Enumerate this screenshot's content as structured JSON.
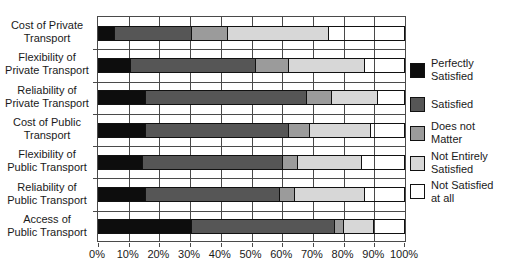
{
  "chart_data": {
    "type": "bar",
    "orientation": "horizontal",
    "stacked": true,
    "title": "",
    "xlabel": "",
    "ylabel": "",
    "xlim": [
      0,
      100
    ],
    "x_ticks": [
      "0%",
      "10%",
      "20%",
      "30%",
      "40%",
      "50%",
      "60%",
      "70%",
      "80%",
      "90%",
      "100%"
    ],
    "grid": "both",
    "legend_position": "right",
    "categories": [
      [
        "Cost of Private",
        "Transport"
      ],
      [
        "Flexibility of",
        "Private Transport"
      ],
      [
        "Reliability of",
        "Private Transport"
      ],
      [
        "Cost of Public",
        "Transport"
      ],
      [
        "Flexibility of",
        "Public Transport"
      ],
      [
        "Reliability of",
        "Public Transport"
      ],
      [
        "Access of",
        "Public Transport"
      ]
    ],
    "series": [
      {
        "name": "Perfectly Satisfied",
        "label_lines": [
          "Perfectly",
          "Satisfied"
        ],
        "color": "#0d0d0d",
        "values": [
          5,
          10,
          15,
          15,
          14,
          15,
          30
        ]
      },
      {
        "name": "Satisfied",
        "label_lines": [
          "Satisfied"
        ],
        "color": "#565656",
        "values": [
          25,
          41,
          53,
          47,
          46,
          44,
          47
        ]
      },
      {
        "name": "Does not Matter",
        "label_lines": [
          "Does not",
          "Matter"
        ],
        "color": "#9b9b9b",
        "values": [
          12,
          11,
          8,
          7,
          5,
          5,
          3
        ]
      },
      {
        "name": "Not Entirely Satisfied",
        "label_lines": [
          "Not Entirely",
          "Satisfied"
        ],
        "color": "#d7d7d7",
        "values": [
          33,
          25,
          15,
          20,
          21,
          23,
          10
        ]
      },
      {
        "name": "Not Satisfied at all",
        "label_lines": [
          "Not Satisfied",
          "at all"
        ],
        "color": "#ffffff",
        "values": [
          25,
          13,
          9,
          11,
          14,
          13,
          10
        ]
      }
    ],
    "units": "%"
  }
}
